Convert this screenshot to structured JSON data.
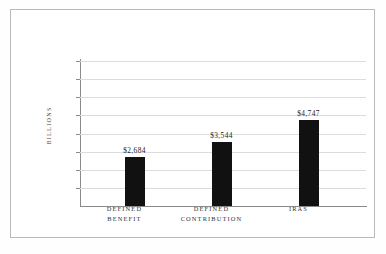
{
  "chart_data": {
    "type": "bar",
    "title": "",
    "subtitle": "",
    "xlabel": "",
    "ylabel": "BILLIONS",
    "categories": [
      "DEFINED BENEFIT",
      "DEFINED CONTRIBUTION",
      "IRAS"
    ],
    "category_lines": [
      [
        "DEFINED",
        "BENEFIT"
      ],
      [
        "DEFINED",
        "CONTRIBUTION"
      ],
      [
        "IRAS",
        ""
      ]
    ],
    "values": [
      2684,
      3544,
      4747
    ],
    "value_labels": [
      "$2,684",
      "$3,544",
      "$4,747"
    ],
    "ylim": [
      0,
      8000
    ],
    "ytick_values": [
      1000,
      2000,
      3000,
      4000,
      5000,
      6000,
      7000,
      8000
    ],
    "ytick_labels": [
      "1,000",
      "2,000",
      "3,000",
      "4,000",
      "5,000",
      "6,000",
      "7,000",
      "$8,000"
    ],
    "grid": true,
    "legend": false,
    "legend_position": "none",
    "bar_color": "#111111",
    "grid_color": "#dcdcdc",
    "axis_color": "#8a8a8a",
    "frame_color": "#b9b9b9",
    "background_color": "#ffffff"
  }
}
